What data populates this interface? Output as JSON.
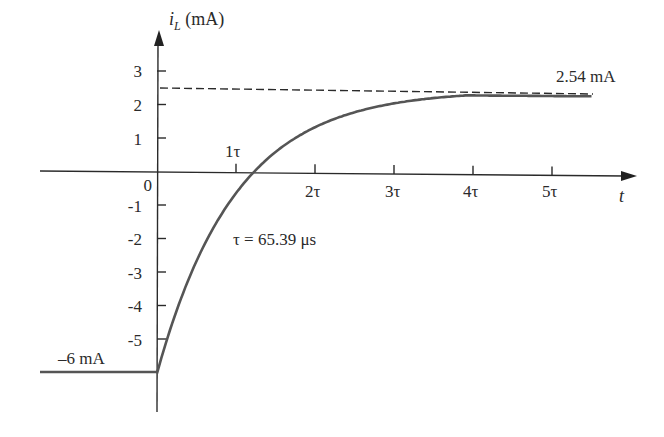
{
  "chart_data": {
    "type": "line",
    "title": "",
    "ylabel": "i_L (mA)",
    "ylabel_main": "i",
    "ylabel_sub": "L",
    "ylabel_unit": "(mA)",
    "xlabel": "t",
    "y_ticks": [
      "3",
      "2",
      "1",
      "0",
      "-1",
      "-2",
      "-3",
      "-4",
      "-5"
    ],
    "y_tick_values": [
      3,
      2,
      1,
      0,
      -1,
      -2,
      -3,
      -4,
      -5
    ],
    "x_ticks": [
      "1τ",
      "2τ",
      "3τ",
      "4τ",
      "5τ"
    ],
    "x_tick_values": [
      1,
      2,
      3,
      4,
      5
    ],
    "ylim": [
      -6.5,
      3.8
    ],
    "xlim": [
      -1.5,
      6
    ],
    "grid": false,
    "series": [
      {
        "name": "i_L(t)",
        "description": "Initial -6 mA for t<0, then exponential rise toward 2.54 mA",
        "initial_value": -6,
        "final_value": 2.54,
        "x": [
          -1.5,
          0,
          0,
          0.5,
          1,
          1.5,
          2,
          2.5,
          3,
          3.5,
          4,
          4.5,
          5,
          5.5
        ],
        "values": [
          -6,
          -6,
          -6,
          -2.24,
          -0.56,
          0.54,
          1.26,
          1.76,
          2.09,
          2.29,
          2.38,
          2.44,
          2.48,
          2.5
        ]
      },
      {
        "name": "asymptote",
        "style": "dashed",
        "value": 2.54
      }
    ],
    "annotations": {
      "final": "2.54 mA",
      "initial": "–6 mA",
      "tau": "τ = 65.39 μs",
      "origin": "0"
    }
  }
}
